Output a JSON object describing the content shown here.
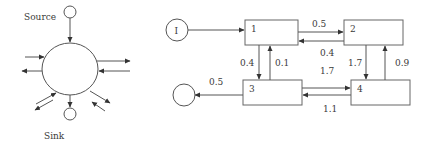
{
  "left_diagram": {
    "source_label": "Source",
    "sink_label": "Sink"
  },
  "right_diagram": {
    "input_node": "I",
    "boxes": [
      {
        "id": "1",
        "label": "1"
      },
      {
        "id": "2",
        "label": "2"
      },
      {
        "id": "3",
        "label": "3"
      },
      {
        "id": "4",
        "label": "4"
      }
    ],
    "flows": {
      "f1_to_2": "0.5",
      "f2_to_1": "0.4",
      "f1_to_3": "0.4",
      "f3_to_1": "0.1",
      "f2_to_4": "1.7",
      "f4_to_2": "0.9",
      "f3_to_4": "1.7",
      "f4_to_3": "1.1",
      "f3_to_sink": "0.5"
    }
  },
  "colors": {
    "line": "#555555",
    "text": "#3a3a3a",
    "background": "#ffffff"
  }
}
